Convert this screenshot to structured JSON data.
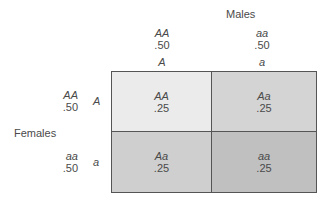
{
  "diagram": {
    "type": "punnett-square",
    "males": {
      "title": "Males",
      "genotypes": [
        {
          "genotype": "AA",
          "frequency": ".50",
          "gamete": "A"
        },
        {
          "genotype": "aa",
          "frequency": ".50",
          "gamete": "a"
        }
      ]
    },
    "females": {
      "title": "Females",
      "genotypes": [
        {
          "genotype": "AA",
          "frequency": ".50",
          "gamete": "A"
        },
        {
          "genotype": "aa",
          "frequency": ".50",
          "gamete": "a"
        }
      ]
    },
    "cells": [
      [
        {
          "genotype": "AA",
          "frequency": ".25",
          "color": "#ebebeb"
        },
        {
          "genotype": "Aa",
          "frequency": ".25",
          "color": "#d4d4d4"
        }
      ],
      [
        {
          "genotype": "Aa",
          "frequency": ".25",
          "color": "#cfcfcf"
        },
        {
          "genotype": "aa",
          "frequency": ".25",
          "color": "#c0c0c0"
        }
      ]
    ]
  }
}
